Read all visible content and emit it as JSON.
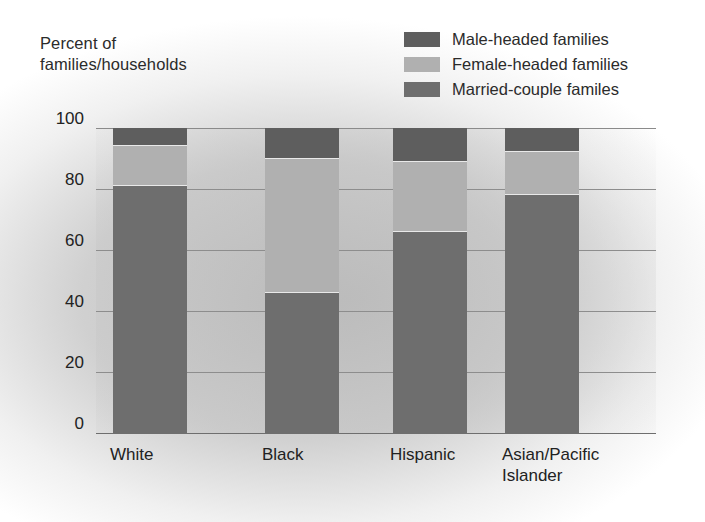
{
  "axis_title": "Percent of\nfamilies/households",
  "legend": {
    "items": [
      {
        "label": "Male-headed families",
        "color": "#5e5e5e",
        "key": "male"
      },
      {
        "label": "Female-headed families",
        "color": "#b0b0b0",
        "key": "female"
      },
      {
        "label": "Married-couple familes",
        "color": "#6e6e6e",
        "key": "married"
      }
    ]
  },
  "credit": "ock Boston",
  "chart_data": {
    "type": "bar",
    "subtype": "stacked-100",
    "title": "",
    "xlabel": "",
    "ylabel": "Percent of families/households",
    "ylim": [
      0,
      100
    ],
    "yticks": [
      "0",
      "20",
      "40",
      "60",
      "80",
      "100"
    ],
    "grid": true,
    "legend_position": "top-right",
    "categories": [
      "White",
      "Black",
      "Hispanic",
      "Asian/Pacific\nIslander"
    ],
    "category_labels_plain": [
      "White",
      "Black",
      "Hispanic",
      "Asian/Pacific Islander"
    ],
    "series": [
      {
        "name": "Married-couple familes",
        "color": "#6e6e6e",
        "values": [
          81,
          46,
          66,
          78
        ]
      },
      {
        "name": "Female-headed families",
        "color": "#b0b0b0",
        "values": [
          13,
          44,
          23,
          14
        ]
      },
      {
        "name": "Male-headed families",
        "color": "#5e5e5e",
        "values": [
          6,
          10,
          11,
          8
        ]
      }
    ],
    "stack_order_bottom_to_top": [
      "Married-couple familes",
      "Female-headed families",
      "Male-headed families"
    ],
    "bar_geometry": [
      {
        "category": "White",
        "left_pct": 3.0,
        "width_pct": 13.2
      },
      {
        "category": "Black",
        "left_pct": 30.2,
        "width_pct": 13.2
      },
      {
        "category": "Hispanic",
        "left_pct": 53.0,
        "width_pct": 13.2
      },
      {
        "category": "Asian/Pacific Islander",
        "left_pct": 73.0,
        "width_pct": 13.2
      }
    ],
    "xtick_positions_px": [
      110,
      262,
      390,
      502
    ]
  }
}
